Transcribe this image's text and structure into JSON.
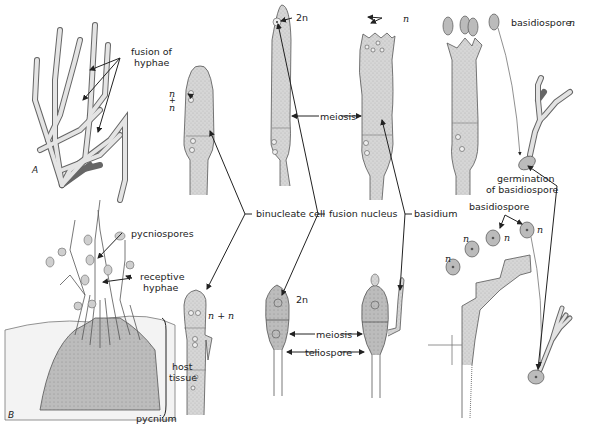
{
  "figure": {
    "panels": {
      "A": "A",
      "B": "B"
    },
    "labels": {
      "fusion_of_hyphae_1": "fusion of",
      "fusion_of_hyphae_2": "hyphae",
      "pycniospores": "pycniospores",
      "receptive_hyphae_1": "receptive",
      "receptive_hyphae_2": "hyphae",
      "host_tissue_1": "host",
      "host_tissue_2": "tissue",
      "pycnium": "pycnium",
      "binucleate_cell": "binucleate cell",
      "fusion_nucleus": "fusion nucleus",
      "basidium": "basidium",
      "meiosis_top": "meiosis",
      "meiosis_bottom": "meiosis",
      "teliospore": "teliospore",
      "basidiospore_top": "basidiospore",
      "basidiospore_mid": "basidiospore",
      "germination_1": "germination",
      "germination_2": "of basidiospore"
    },
    "ploidy": {
      "n_plus_n_top_n1": "n",
      "n_plus_n_top_plus": "+",
      "n_plus_n_top_n2": "n",
      "two_n_top": "2n",
      "n_basidium_top": "n",
      "n_basidiospore_top": "n",
      "n_plus_n_bottom": "n + n",
      "two_n_bottom": "2n",
      "n_spore_1": "n",
      "n_spore_2": "n",
      "n_spore_3": "n",
      "n_spore_4": "n"
    },
    "colors": {
      "cell_fill": "#d9d9d9",
      "dark_fill": "#b8b8b8",
      "outline": "#555555",
      "ink": "#222222"
    }
  }
}
